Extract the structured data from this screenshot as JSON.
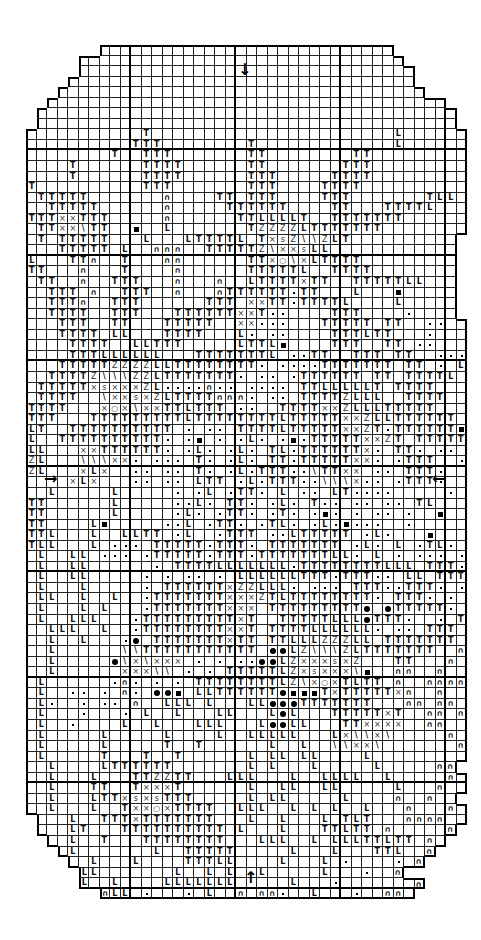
{
  "chart": {
    "title": "",
    "columns": 42,
    "rows_count": 82,
    "major_grid_every": 10,
    "legend_symbols": {
      "T": "T",
      "L": "L",
      "x": "×",
      "d": "dot",
      "o": "filled-circle",
      "b": "filled-square",
      "\\": "\\",
      "n": "∩",
      "Z": "Z",
      "s": "s",
      "O": "○",
      ".": "empty",
      "_": "outside"
    },
    "center_markers": {
      "top": "↓",
      "bottom": "↑",
      "left": "→",
      "right": "←"
    },
    "grid": [
      "_______............................_______",
      "_____...............................______",
      "_____................................_____",
      "____.................................____",
      "___...................................___",
      "__......................................__",
      "_........................................_",
      "_........................................_",
      "...........T.......................L......",
      "..........TTT........T.............L......",
      "........T..TTT.......TT........TT.........",
      "....T......TTTT......TT.......TTT.........",
      "....T......TTTT......TTT.....TTTT.........",
      "T..........TTT.......TTT....TTTT..........",
      ".TTTTT.......n....TT.TTT....TTT.......TLL.",
      "..TTTTT......n.....TTTTTT....TT...TTTTL...",
      "TTTxxTTT.....n......TTLLLLT..TTTTTTT......",
      ".TTxx\\TT..b..L.......TZZZZLTTTTTTT........",
      ".T.TTTTT...L...LTTTTL.TxsZ\\\\ZLT..........",
      "...TTTTT.L..nnn..TTTTTZ\\xxsLL............",
      "L...TTn..T...nn......TTxO\\xLTTTT.........",
      "TT...n...T....n......TTTTTL..TTTT........",
      ".TT..n..TTT...n...n..LTTTTxTT..TTTTTLL...",
      "..TTT.n..TTT..n...nTTTTTTdTT...L...b.....",
      "..TTTn..TTT......TTT.xxTTdTTTTL....L.....",
      "..TTTT..TTT...TTTTTTxxTdd....TTT....d....",
      "...TTT..TT...TTTTT..xxddd...TTTTT.TT..dd..",
      "...TTTT.LL...TTTT...Ld.dd....TTTLTT...d...",
      "....TTTT..LLTTT.....LTTLb....TTT..TT.dd...",
      "....TTTLLLLLL...TTTTTTTL.ddTT..TTT.TT..ddd",
      "...TTTTTZZZZLLTTTTTTTTd.ddddTTTTTTT.TT.d.L",
      "..TTTTZ\\\\\\ZZLTTTTTTTd.dd.dTTTTTT.TT.TTTTL.",
      ".TTTTTxsxxxZLddddndd.dddd.TTLLLLLT.TTTT...",
      ".TTTT..\\xxsxZLTTTTnnnd.dd.TTTTZLLL..TTTT..",
      "TTTT...xOx\\xxTTLTTT.dd..TTTTxxZLLLTTTTT...",
      "TTT...TTTTTTTTTLTTTTTTTTLTTTTTxxZLLTTTTTT.",
      "LT..TTTTTTTTTT.d.dd.TTTTLTTTTTxxZTdTTTTTTb",
      "L..TTTTTTTTTTd.db.d.dLd.dbdTTTTTxxZT.TTTTTTTL",
      "LL...xxTTTTTTd.dLd.dLd.TLdTTTTTTxd.TTd.dd.",
      "ZL...\\\\\\xxd.ddd.Td.dLd.TTdTTTTTxxd.dTTT..d.",
      "ZL...xLx..dd.dd.Td.dLdTTTdd\\TTxx.dd.TTTd..d",
      "....xLx...dd.dd.LTT.dLdTTTdd\\\\\\xdd.dTTTd..d",
      "..L.....L.....d.dL.dTTd.L.dd.LTdddd.....d.",
      "TT......L.....ddLd.TTd.dLd.Tdd.dd.dd.TL...",
      "TT......L.....dLd.dTTd.dTd.dbd.d.dd.d..b..",
      "TT....Lb.....ddL.dTTd.dTLd.dLdbddd..d......",
      "TTL...L..LLTT.dL..dTTT.ddLTTTTT.dLd...b....",
      "TLL...L.ddd.TTTTTdTTTd.TTTTTTT.dLd.L.dTLd.d",
      ".L..LL.ddd.dTTTTTdTTTdTTTTTTTLLd.L.d.ddd.dd",
      ".L..LL......d.TTTTLLLLLLLdTTTTTTTTLLL.TTTd.d",
      ".L..LL.....d.d.dd.d.LLLLLLTTTdTTTdd.LL.TTT.d",
      ".L...L.....d.TTTTTTxZZLLLd.ddd.TTTddTTTd.ddd",
      ".LL..L..L..dTTTTTTTxxxZTLTTTTTTTTd.TTTd.d.dd",
      ".L...L.L...dTTTTTTTxxx.TTTTTTTTTo.oTTTTTd.d.",
      ".L..LLL...dTTTTTTTTTxT..TTTTTLLLoTTTd..d.T..",
      "..LLL..L..dTTTTTTTTxxT.TTTTLLLLLLd.dd.TTT.n.",
      "..L..L...do.TTTTTTTxTT.TTLLLZZZLL.TTTTTTT.n..",
      "..L......\\\\TTTTTTTTTTT.ooLZ\\\\\\ZLTTTTTTT..nn",
      "..L.....o\\x\\xxx.d.d.ddooLZxxxsxZ...TT...n..",
      "..L......xxx\\\\.d.d.TTTTTLZxsxxx\\b..nn..n..",
      ".L......dnd.d.d.TTTTTTTTLZ\\xOxTLTT.n..nnnn",
      ".L..dd.d.nd.oob.LLTTTTTTobbbTxTTTTTxn..n...n",
      ".Ld..d.dd.n..LLL.L...LLoooTTTTTTT...nn.nn..n",
      ".L...d...d.L..L...LL...LoL...TTTTTxT..nn.nn..",
      ".L..d....L..L...LLL...LooLL...TTxxxx..nn...n",
      ".L.....L.....L....L..LLLLL...Lx\\\\x\\.....n..",
      ".L.....L.....T..T......L..L..\\\\xx\\.......n",
      ".L.....T...T..T......L.LL.LL....L..........",
      "..L....LTTTTTT.......L.L...L.....L.....nn",
      "..L...L...TTZZTT...LLL...L..LLLL..L.....n.",
      "..L...TT..TxxxT......L..LL..LL.....L...n..",
      "..L...LTTxsxsTTT.....L.LL.....L....n..n..",
      "..L...L..TxxOxTTTT..LLL..L.L.L..L...n...n.",
      "_...L..TTTxTTTTTTT...L..L...L.TLT...nnnn.._",
      "_...LT...TTTTTTTTTT.L...L...TTLTT.n.....n_",
      "__..L..T...TTTTTTTT...LLL..L.LLLTTLTT.n.__",
      "___.L.......L..TTTTT.....L...L...TTL..n___",
      "____..L...L....TTTLL....L...L.d....d.n____",
      "_____LL.......L..L.L..L.....L...d..n______",
      "_____L..L....LLLLLLL.....L...d.......n_____",
      "_______nLL.d...d.L..n.nnd..L...d..nn.__"
    ]
  }
}
